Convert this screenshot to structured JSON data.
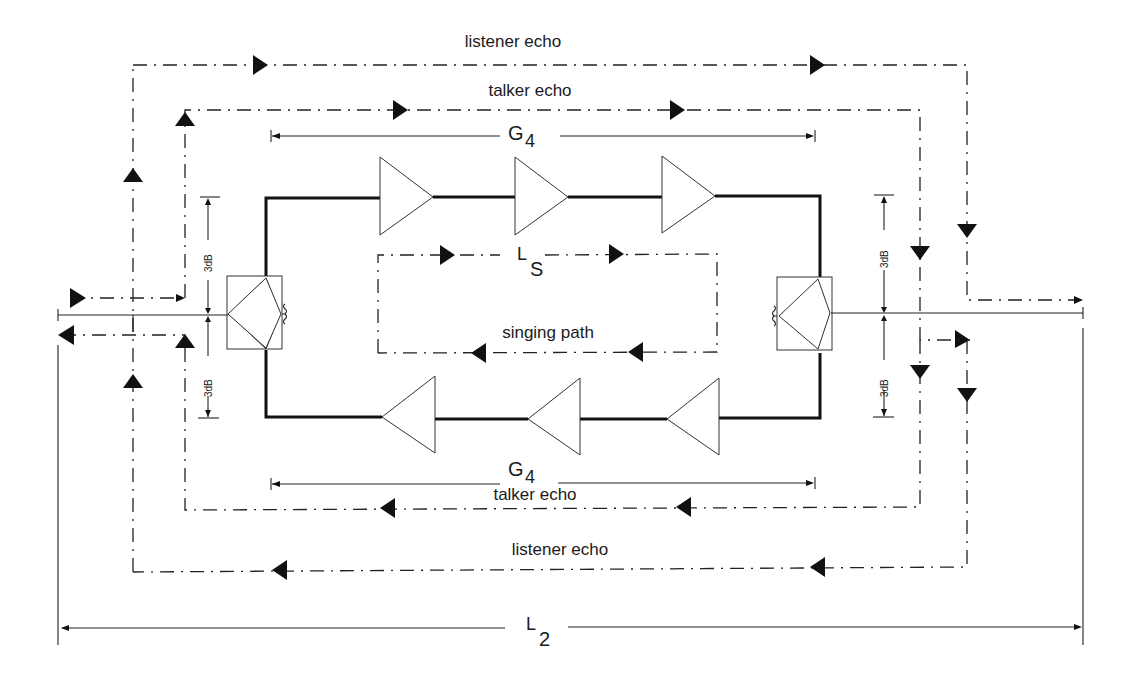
{
  "diagram": {
    "type": "four-wire echo path diagram",
    "labels": {
      "listener_echo_top": "listener echo",
      "talker_echo_top": "talker echo",
      "gain_top_symbol": "G",
      "gain_top_sub": "4",
      "loss_singing_symbol": "L",
      "loss_singing_sub": "S",
      "singing_path": "singing path",
      "gain_bottom_symbol": "G",
      "gain_bottom_sub": "4",
      "talker_echo_bottom": "talker echo",
      "listener_echo_bottom": "listener echo",
      "loss_two_wire_symbol": "L",
      "loss_two_wire_sub": "2",
      "hybrid_loss_left_upper": "3dB",
      "hybrid_loss_left_lower": "3dB",
      "hybrid_loss_right_upper": "3dB",
      "hybrid_loss_right_lower": "3dB"
    },
    "components": {
      "upper_amplifiers": 3,
      "lower_amplifiers": 3,
      "hybrids": [
        "left-hybrid",
        "right-hybrid"
      ],
      "upper_amplifier_direction": "right",
      "lower_amplifier_direction": "left"
    },
    "colors": {
      "line": "#222222",
      "background": "#ffffff"
    }
  }
}
